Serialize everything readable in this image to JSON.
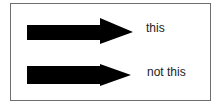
{
  "diagram": {
    "arrows": [
      {
        "id": "top",
        "style": "large-head",
        "label": "this",
        "color": "#000000"
      },
      {
        "id": "bottom",
        "style": "small-head",
        "label": "not this",
        "color": "#000000"
      }
    ],
    "border_color": "#6e6e6e"
  }
}
